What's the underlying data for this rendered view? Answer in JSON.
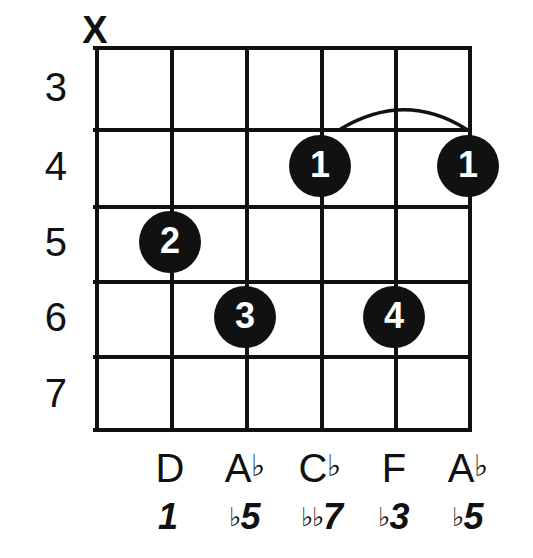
{
  "diagram": {
    "type": "guitar-chord-diagram",
    "string_count": 6,
    "fret_count": 5,
    "geometry": {
      "grid_left": 95,
      "grid_top": 46,
      "grid_right": 468,
      "grid_bottom": 432,
      "string_x": [
        95,
        170,
        245,
        320,
        394,
        468
      ],
      "fret_y": [
        46,
        128,
        205,
        280,
        355,
        432
      ]
    },
    "fret_numbers": [
      {
        "label": "3",
        "y": 87
      },
      {
        "label": "4",
        "y": 166
      },
      {
        "label": "5",
        "y": 242
      },
      {
        "label": "6",
        "y": 317
      },
      {
        "label": "7",
        "y": 393
      }
    ],
    "string_markers": [
      {
        "string": 1,
        "symbol": "X",
        "name": "muted",
        "x": 95,
        "y": 46
      }
    ],
    "finger_dots": [
      {
        "finger": "1",
        "string": 4,
        "fret": 4,
        "x": 320,
        "y": 166
      },
      {
        "finger": "1",
        "string": 6,
        "fret": 4,
        "x": 468,
        "y": 166
      },
      {
        "finger": "2",
        "string": 2,
        "fret": 5,
        "x": 170,
        "y": 242
      },
      {
        "finger": "3",
        "string": 3,
        "fret": 6,
        "x": 245,
        "y": 317
      },
      {
        "finger": "4",
        "string": 5,
        "fret": 6,
        "x": 394,
        "y": 317
      }
    ],
    "barre": {
      "from_string": 4,
      "to_string": 6,
      "fret": 4,
      "path": "M 339 130 Q 404 90 466 129"
    },
    "note_names": [
      {
        "string": 2,
        "letter": "D",
        "accidental": "",
        "x": 170,
        "y": 468
      },
      {
        "string": 3,
        "letter": "A",
        "accidental": "♭",
        "x": 245,
        "y": 468
      },
      {
        "string": 4,
        "letter": "C",
        "accidental": "♭",
        "x": 320,
        "y": 468
      },
      {
        "string": 5,
        "letter": "F",
        "accidental": "",
        "x": 394,
        "y": 468
      },
      {
        "string": 6,
        "letter": "A",
        "accidental": "♭",
        "x": 468,
        "y": 468
      }
    ],
    "intervals": [
      {
        "string": 2,
        "accidental": "",
        "degree": "1",
        "x": 168,
        "y": 517
      },
      {
        "string": 3,
        "accidental": "♭",
        "degree": "5",
        "x": 245,
        "y": 517
      },
      {
        "string": 4,
        "accidental": "♭♭",
        "degree": "7",
        "x": 322,
        "y": 517
      },
      {
        "string": 5,
        "accidental": "♭",
        "degree": "3",
        "x": 394,
        "y": 517
      },
      {
        "string": 6,
        "accidental": "♭",
        "degree": "5",
        "x": 468,
        "y": 517
      }
    ],
    "colors": {
      "ink": "#111111",
      "paper": "#ffffff",
      "dot_fill": "#111111",
      "dot_text": "#ffffff"
    }
  }
}
